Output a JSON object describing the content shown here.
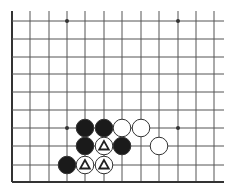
{
  "diagram": {
    "type": "go-board-fragment",
    "colors": {
      "background": "#ffffff",
      "line": "#555555",
      "edge": "#333333",
      "black_stone": "#1a1a1a",
      "white_stone": "#ffffff",
      "stone_outline": "#333333",
      "marker": "#222222"
    },
    "grid": {
      "columns_x": [
        12,
        30,
        49,
        67,
        85,
        104,
        122,
        141,
        159,
        178,
        196,
        214
      ],
      "rows_y": [
        21,
        39,
        57,
        74,
        92,
        110,
        128,
        146,
        165,
        182
      ],
      "top_line_start_y": 11,
      "right_line_end_x": 224,
      "left_edge": true,
      "bottom_edge": true
    },
    "star_points": [
      {
        "col": 3,
        "row": 0
      },
      {
        "col": 9,
        "row": 0
      },
      {
        "col": 3,
        "row": 6
      },
      {
        "col": 9,
        "row": 6
      }
    ],
    "stones": [
      {
        "color": "black",
        "col": 4,
        "row": 6,
        "marker": ""
      },
      {
        "color": "black",
        "col": 5,
        "row": 6,
        "marker": ""
      },
      {
        "color": "white",
        "col": 6,
        "row": 6,
        "marker": ""
      },
      {
        "color": "white",
        "col": 7,
        "row": 6,
        "marker": ""
      },
      {
        "color": "black",
        "col": 4,
        "row": 7,
        "marker": ""
      },
      {
        "color": "white",
        "col": 5,
        "row": 7,
        "marker": "triangle"
      },
      {
        "color": "black",
        "col": 6,
        "row": 7,
        "marker": ""
      },
      {
        "color": "white",
        "col": 8,
        "row": 7,
        "marker": ""
      },
      {
        "color": "black",
        "col": 3,
        "row": 8,
        "marker": ""
      },
      {
        "color": "white",
        "col": 4,
        "row": 8,
        "marker": "triangle"
      },
      {
        "color": "white",
        "col": 5,
        "row": 8,
        "marker": "triangle"
      }
    ]
  }
}
